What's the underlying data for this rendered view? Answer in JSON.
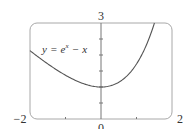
{
  "chart_data": {
    "type": "line",
    "title": "",
    "function": "y = e^x - x",
    "annotation": {
      "text_y": "y",
      "text_eq": "=",
      "text_e": "e",
      "text_sup": "x",
      "text_minus": "−",
      "text_x": "x"
    },
    "xlim": [
      -2,
      2
    ],
    "ylim": [
      0,
      3
    ],
    "x_tick_labels": {
      "left": "−2",
      "center": "0",
      "right": "2"
    },
    "y_tick_labels": {
      "top": "3"
    },
    "y_minor_ticks": [
      0.5,
      1,
      1.5,
      2,
      2.5
    ],
    "x_minor_ticks": [
      -1,
      1
    ],
    "grid": false,
    "series": [
      {
        "name": "y = e^x - x",
        "x": [
          -2,
          -1.5,
          -1,
          -0.5,
          0,
          0.5,
          1,
          1.25,
          1.505
        ],
        "y": [
          2.135,
          1.723,
          1.368,
          1.107,
          1.0,
          1.149,
          1.718,
          2.24,
          3.0
        ]
      }
    ],
    "colors": {
      "curve": "#555555",
      "frame": "#999999",
      "axis": "#777777"
    }
  }
}
